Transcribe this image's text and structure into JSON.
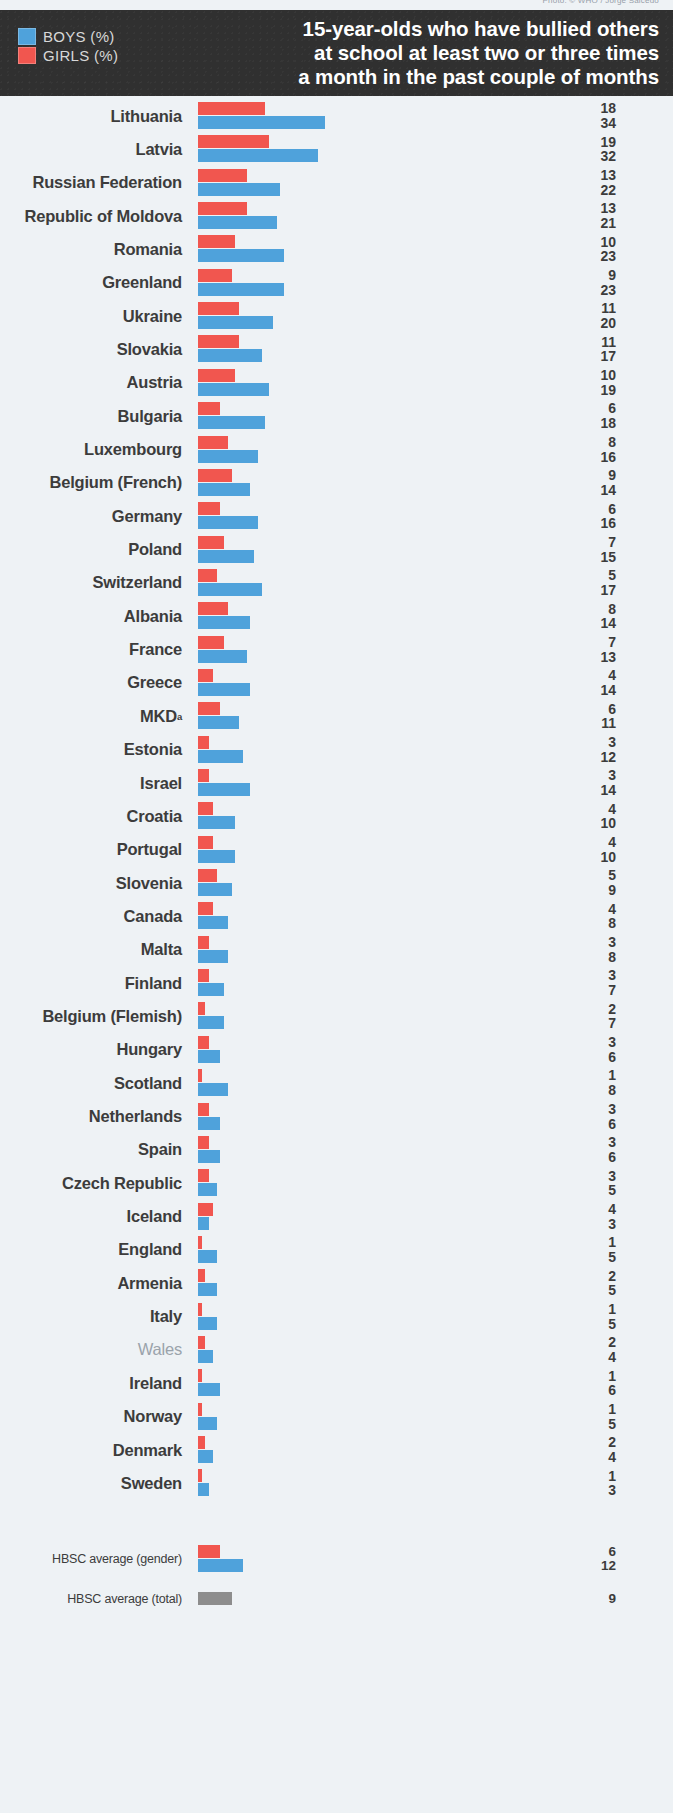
{
  "credit": "Photo: © WHO / Jorge Salcedo",
  "header": {
    "title_lines": [
      "15-year-olds who have bullied others",
      "at school at least two or three times",
      "a month in the past couple of months"
    ],
    "legend": [
      {
        "label": "BOYS (%)",
        "color": "#4fa2db",
        "series": "boys"
      },
      {
        "label": "GIRLS (%)",
        "color": "#f1564f",
        "series": "girls"
      }
    ]
  },
  "chart_data": {
    "type": "bar",
    "orientation": "horizontal",
    "xlabel": "",
    "ylabel": "",
    "xlim": [
      0,
      34
    ],
    "grid": false,
    "legend_position": "top-left",
    "value_labels": true,
    "series": [
      {
        "name": "GIRLS (%)",
        "color": "#f1564f",
        "values": [
          18,
          19,
          13,
          13,
          10,
          9,
          11,
          11,
          10,
          6,
          8,
          9,
          6,
          7,
          5,
          8,
          7,
          4,
          6,
          3,
          3,
          4,
          4,
          5,
          4,
          3,
          3,
          2,
          3,
          1,
          3,
          3,
          3,
          4,
          1,
          2,
          1,
          2,
          1,
          1,
          2,
          1
        ]
      },
      {
        "name": "BOYS (%)",
        "color": "#4fa2db",
        "values": [
          34,
          32,
          22,
          21,
          23,
          23,
          20,
          17,
          19,
          18,
          16,
          14,
          16,
          15,
          17,
          14,
          13,
          14,
          11,
          12,
          14,
          10,
          10,
          9,
          8,
          8,
          7,
          7,
          6,
          8,
          6,
          6,
          5,
          3,
          5,
          5,
          5,
          4,
          6,
          5,
          4,
          3
        ]
      }
    ],
    "categories": [
      "Lithuania",
      "Latvia",
      "Russian Federation",
      "Republic of Moldova",
      "Romania",
      "Greenland",
      "Ukraine",
      "Slovakia",
      "Austria",
      "Bulgaria",
      "Luxembourg",
      "Belgium (French)",
      "Germany",
      "Poland",
      "Switzerland",
      "Albania",
      "France",
      "Greece",
      "MKD",
      "Estonia",
      "Israel",
      "Croatia",
      "Portugal",
      "Slovenia",
      "Canada",
      "Malta",
      "Finland",
      "Belgium (Flemish)",
      "Hungary",
      "Scotland",
      "Netherlands",
      "Spain",
      "Czech Republic",
      "Iceland",
      "England",
      "Armenia",
      "Italy",
      "Wales",
      "Ireland",
      "Norway",
      "Denmark",
      "Sweden"
    ],
    "averages": [
      {
        "label": "HBSC average (gender)",
        "girls": 6,
        "boys": 12
      },
      {
        "label": "HBSC average (total)",
        "total": 9,
        "color": "#8d8d8d"
      }
    ]
  },
  "rows": [
    {
      "country": "Lithuania",
      "girls": 18,
      "boys": 34,
      "dim": false
    },
    {
      "country": "Latvia",
      "girls": 19,
      "boys": 32,
      "dim": false
    },
    {
      "country": "Russian Federation",
      "girls": 13,
      "boys": 22,
      "dim": false
    },
    {
      "country": "Republic of Moldova",
      "girls": 13,
      "boys": 21,
      "dim": false
    },
    {
      "country": "Romania",
      "girls": 10,
      "boys": 23,
      "dim": false
    },
    {
      "country": "Greenland",
      "girls": 9,
      "boys": 23,
      "dim": false
    },
    {
      "country": "Ukraine",
      "girls": 11,
      "boys": 20,
      "dim": false
    },
    {
      "country": "Slovakia",
      "girls": 11,
      "boys": 17,
      "dim": false
    },
    {
      "country": "Austria",
      "girls": 10,
      "boys": 19,
      "dim": false
    },
    {
      "country": "Bulgaria",
      "girls": 6,
      "boys": 18,
      "dim": false
    },
    {
      "country": "Luxembourg",
      "girls": 8,
      "boys": 16,
      "dim": false
    },
    {
      "country": "Belgium (French)",
      "girls": 9,
      "boys": 14,
      "dim": false
    },
    {
      "country": "Germany",
      "girls": 6,
      "boys": 16,
      "dim": false
    },
    {
      "country": "Poland",
      "girls": 7,
      "boys": 15,
      "dim": false
    },
    {
      "country": "Switzerland",
      "girls": 5,
      "boys": 17,
      "dim": false
    },
    {
      "country": "Albania",
      "girls": 8,
      "boys": 14,
      "dim": false
    },
    {
      "country": "France",
      "girls": 7,
      "boys": 13,
      "dim": false
    },
    {
      "country": "Greece",
      "girls": 4,
      "boys": 14,
      "dim": false
    },
    {
      "country": "MKD",
      "girls": 6,
      "boys": 11,
      "dim": false,
      "sup": "a"
    },
    {
      "country": "Estonia",
      "girls": 3,
      "boys": 12,
      "dim": false
    },
    {
      "country": "Israel",
      "girls": 3,
      "boys": 14,
      "dim": false
    },
    {
      "country": "Croatia",
      "girls": 4,
      "boys": 10,
      "dim": false
    },
    {
      "country": "Portugal",
      "girls": 4,
      "boys": 10,
      "dim": false
    },
    {
      "country": "Slovenia",
      "girls": 5,
      "boys": 9,
      "dim": false
    },
    {
      "country": "Canada",
      "girls": 4,
      "boys": 8,
      "dim": false
    },
    {
      "country": "Malta",
      "girls": 3,
      "boys": 8,
      "dim": false
    },
    {
      "country": "Finland",
      "girls": 3,
      "boys": 7,
      "dim": false
    },
    {
      "country": "Belgium (Flemish)",
      "girls": 2,
      "boys": 7,
      "dim": false
    },
    {
      "country": "Hungary",
      "girls": 3,
      "boys": 6,
      "dim": false
    },
    {
      "country": "Scotland",
      "girls": 1,
      "boys": 8,
      "dim": false
    },
    {
      "country": "Netherlands",
      "girls": 3,
      "boys": 6,
      "dim": false
    },
    {
      "country": "Spain",
      "girls": 3,
      "boys": 6,
      "dim": false
    },
    {
      "country": "Czech Republic",
      "girls": 3,
      "boys": 5,
      "dim": false
    },
    {
      "country": "Iceland",
      "girls": 4,
      "boys": 3,
      "dim": false
    },
    {
      "country": "England",
      "girls": 1,
      "boys": 5,
      "dim": false
    },
    {
      "country": "Armenia",
      "girls": 2,
      "boys": 5,
      "dim": false
    },
    {
      "country": "Italy",
      "girls": 1,
      "boys": 5,
      "dim": false
    },
    {
      "country": "Wales",
      "girls": 2,
      "boys": 4,
      "dim": true
    },
    {
      "country": "Ireland",
      "girls": 1,
      "boys": 6,
      "dim": false
    },
    {
      "country": "Norway",
      "girls": 1,
      "boys": 5,
      "dim": false
    },
    {
      "country": "Denmark",
      "girls": 2,
      "boys": 4,
      "dim": false
    },
    {
      "country": "Sweden",
      "girls": 1,
      "boys": 3,
      "dim": false
    }
  ],
  "averages": [
    {
      "country": "HBSC average (gender)",
      "girls": 6,
      "boys": 12
    },
    {
      "country": "HBSC average (total)",
      "total": 9
    }
  ]
}
